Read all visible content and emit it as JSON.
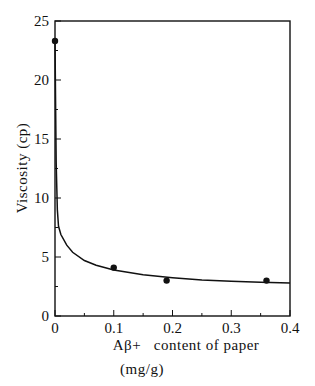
{
  "chart_data": {
    "type": "scatter",
    "title": "",
    "xlabel": "Aβ+   content of paper",
    "xlabel_unit": "(mg/g)",
    "ylabel": "Viscosity (cp)",
    "xlim": [
      0,
      0.4
    ],
    "ylim": [
      0,
      25
    ],
    "x_ticks": [
      0,
      0.1,
      0.2,
      0.3,
      0.4
    ],
    "x_tick_labels": [
      "0",
      "0.1",
      "0.2",
      "0.3",
      "0.4"
    ],
    "x_minor_step": 0.05,
    "y_ticks": [
      0,
      5,
      10,
      15,
      20,
      25
    ],
    "y_tick_labels": [
      "0",
      "5",
      "10",
      "15",
      "20",
      "25"
    ],
    "y_minor_step": 2.5,
    "grid": false,
    "legend": null,
    "series": [
      {
        "name": "measured",
        "style": "markers",
        "x": [
          0,
          0.1,
          0.19,
          0.36
        ],
        "y": [
          23.3,
          4.1,
          3.0,
          3.0
        ]
      },
      {
        "name": "fitted curve",
        "style": "line",
        "x": [
          0,
          0.001,
          0.002,
          0.004,
          0.006,
          0.01,
          0.02,
          0.03,
          0.05,
          0.07,
          0.1,
          0.15,
          0.2,
          0.25,
          0.3,
          0.35,
          0.4
        ],
        "y": [
          23.3,
          18.0,
          13.0,
          9.0,
          7.6,
          6.9,
          6.0,
          5.4,
          4.7,
          4.3,
          3.9,
          3.5,
          3.25,
          3.05,
          2.95,
          2.85,
          2.8
        ]
      }
    ]
  }
}
